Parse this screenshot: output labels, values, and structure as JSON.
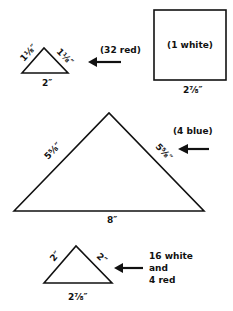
{
  "pieces": [
    {
      "shape": "small-triangle",
      "side_labels": {
        "left": "1⅛″",
        "right": "1⅛″",
        "base": "2″"
      },
      "quantity_note": "(32 red)"
    },
    {
      "shape": "square",
      "inside_label": "(1 white)",
      "base_label": "2⅞″"
    },
    {
      "shape": "large-triangle",
      "side_labels": {
        "left": "5⅝″",
        "right": "5⅝″",
        "base": "8″"
      },
      "quantity_note": "(4 blue)"
    },
    {
      "shape": "medium-triangle",
      "side_labels": {
        "left": "2″",
        "right": "2″",
        "base": "2⅞″"
      },
      "quantity_note_lines": [
        "16 white",
        "and",
        "4 red"
      ]
    }
  ],
  "colors": {
    "line": "#111111",
    "background": "#ffffff"
  }
}
